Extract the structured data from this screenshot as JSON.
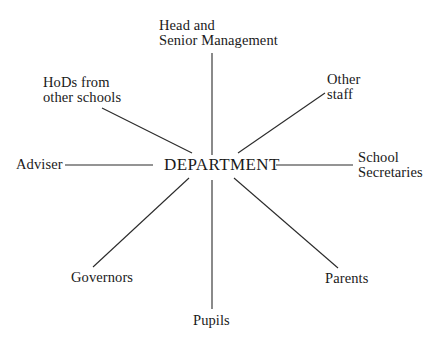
{
  "diagram": {
    "type": "hub-and-spoke",
    "center": {
      "label": "DEPARTMENT"
    },
    "nodes": [
      {
        "id": "head",
        "lines": [
          "Head and",
          "Senior Management"
        ]
      },
      {
        "id": "hods",
        "lines": [
          "HoDs from",
          "other schools"
        ]
      },
      {
        "id": "other_staff",
        "lines": [
          "Other",
          "staff"
        ]
      },
      {
        "id": "adviser",
        "lines": [
          "Adviser"
        ]
      },
      {
        "id": "school_secretaries",
        "lines": [
          "School",
          "Secretaries"
        ]
      },
      {
        "id": "governors",
        "lines": [
          "Governors"
        ]
      },
      {
        "id": "parents",
        "lines": [
          "Parents"
        ]
      },
      {
        "id": "pupils",
        "lines": [
          "Pupils"
        ]
      }
    ],
    "edges": [
      {
        "from": "DEPARTMENT",
        "to": "head"
      },
      {
        "from": "DEPARTMENT",
        "to": "hods"
      },
      {
        "from": "DEPARTMENT",
        "to": "other_staff"
      },
      {
        "from": "DEPARTMENT",
        "to": "adviser"
      },
      {
        "from": "DEPARTMENT",
        "to": "school_secretaries"
      },
      {
        "from": "DEPARTMENT",
        "to": "governors"
      },
      {
        "from": "DEPARTMENT",
        "to": "parents"
      },
      {
        "from": "DEPARTMENT",
        "to": "pupils"
      }
    ],
    "colors": {
      "line": "#2a2a2a",
      "text": "#1a1a1a",
      "background": "#ffffff"
    }
  }
}
